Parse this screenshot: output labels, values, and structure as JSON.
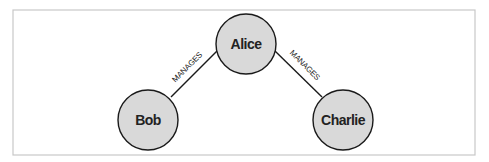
{
  "diagram": {
    "frame": {
      "x": 13,
      "y": 10,
      "width": 462,
      "height": 145,
      "stroke": "#c8c8c8"
    },
    "style": {
      "node_fill": "#d9d9d9",
      "node_stroke": "#1a1a1a",
      "edge_stroke": "#1a1a1a",
      "text_color": "#222222"
    },
    "nodes": [
      {
        "id": "alice",
        "label": "Alice",
        "cx": 246,
        "cy": 44,
        "r": 30
      },
      {
        "id": "bob",
        "label": "Bob",
        "cx": 148,
        "cy": 120,
        "r": 30
      },
      {
        "id": "charlie",
        "label": "Charlie",
        "cx": 343,
        "cy": 120,
        "r": 30
      }
    ],
    "edges": [
      {
        "from": "alice",
        "to": "bob",
        "label": "MANAGES"
      },
      {
        "from": "alice",
        "to": "charlie",
        "label": "MANAGES"
      }
    ]
  }
}
